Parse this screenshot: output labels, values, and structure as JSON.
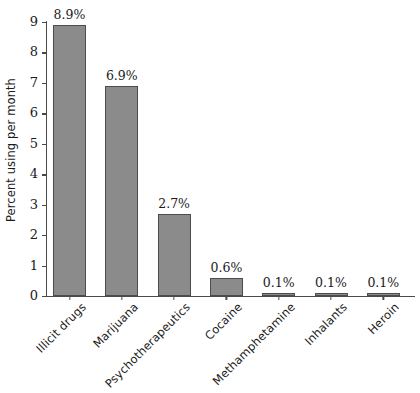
{
  "chart_data": {
    "type": "bar",
    "title": "",
    "subtitle": "",
    "xlabel": "",
    "ylabel": "Percent using per month",
    "ylim": [
      0,
      9
    ],
    "yticks": [
      "0",
      "1",
      "2",
      "3",
      "4",
      "5",
      "6",
      "7",
      "8",
      "9"
    ],
    "grid": false,
    "legend": null,
    "bar_color": "#8b8b8b",
    "bar_border_color": "#4c4c4c",
    "axis_color": "#4a4a4a",
    "background_color": "#ffffff",
    "categories": [
      "Illicit drugs",
      "Marijuana",
      "Psychotherapeutics",
      "Cocaine",
      "Methamphetamine",
      "Inhalants",
      "Heroin"
    ],
    "values": [
      8.9,
      6.9,
      2.7,
      0.6,
      0.1,
      0.1,
      0.1
    ],
    "value_labels": [
      "8.9%",
      "6.9%",
      "2.7%",
      "0.6%",
      "0.1%",
      "0.1%",
      "0.1%"
    ]
  }
}
